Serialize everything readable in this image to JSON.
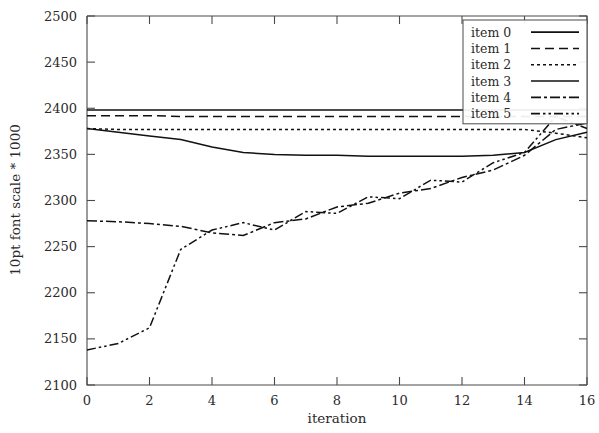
{
  "chart_data": {
    "type": "line",
    "title": "",
    "xlabel": "iteration",
    "ylabel": "10pt font scale * 1000",
    "xlim": [
      0,
      16
    ],
    "ylim": [
      2100,
      2500
    ],
    "xticks": [
      0,
      2,
      4,
      6,
      8,
      10,
      12,
      14,
      16
    ],
    "yticks": [
      2100,
      2150,
      2200,
      2250,
      2300,
      2350,
      2400,
      2450,
      2500
    ],
    "grid": false,
    "legend_position": "top-right",
    "x": [
      0,
      1,
      2,
      3,
      4,
      5,
      6,
      7,
      8,
      9,
      10,
      11,
      12,
      13,
      14,
      15,
      16
    ],
    "series": [
      {
        "name": "item 0",
        "dash": "none",
        "values": [
          2398,
          2398,
          2398,
          2398,
          2398,
          2398,
          2398,
          2398,
          2398,
          2398,
          2398,
          2398,
          2398,
          2398,
          2398,
          2398,
          2398
        ]
      },
      {
        "name": "item 1",
        "dash": "dashed",
        "values": [
          2392,
          2392,
          2392,
          2391,
          2391,
          2391,
          2391,
          2391,
          2391,
          2391,
          2391,
          2391,
          2391,
          2391,
          2391,
          2391,
          2391
        ]
      },
      {
        "name": "item 2",
        "dash": "dotted",
        "values": [
          2378,
          2377,
          2377,
          2377,
          2377,
          2377,
          2377,
          2377,
          2377,
          2377,
          2377,
          2377,
          2377,
          2377,
          2377,
          2373,
          2368
        ]
      },
      {
        "name": "item 3",
        "dash": "solid-thin",
        "values": [
          2378,
          2374,
          2370,
          2366,
          2358,
          2352,
          2350,
          2349,
          2349,
          2348,
          2348,
          2348,
          2348,
          2349,
          2352,
          2366,
          2374
        ]
      },
      {
        "name": "item 4",
        "dash": "dashdot",
        "values": [
          2278,
          2277,
          2275,
          2272,
          2265,
          2262,
          2276,
          2280,
          2293,
          2297,
          2308,
          2313,
          2325,
          2333,
          2349,
          2377,
          2384
        ]
      },
      {
        "name": "item 5",
        "dash": "dashdotdot",
        "values": [
          2138,
          2145,
          2162,
          2247,
          2268,
          2276,
          2268,
          2288,
          2286,
          2304,
          2302,
          2322,
          2320,
          2341,
          2352,
          2391,
          2378
        ]
      }
    ]
  },
  "legend": {
    "items": [
      {
        "label": "item 0"
      },
      {
        "label": "item 1"
      },
      {
        "label": "item 2"
      },
      {
        "label": "item 3"
      },
      {
        "label": "item 4"
      },
      {
        "label": "item 5"
      }
    ]
  },
  "axes": {
    "x_title": "iteration",
    "y_title": "10pt font scale * 1000",
    "x_tick_labels": [
      "0",
      "2",
      "4",
      "6",
      "8",
      "10",
      "12",
      "14",
      "16"
    ],
    "y_tick_labels": [
      "2100",
      "2150",
      "2200",
      "2250",
      "2300",
      "2350",
      "2400",
      "2450",
      "2500"
    ]
  }
}
